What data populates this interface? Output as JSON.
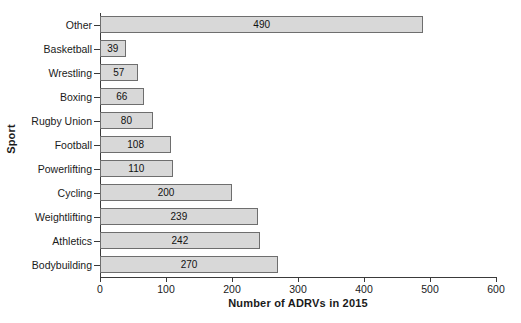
{
  "chart_data": {
    "type": "bar",
    "orientation": "horizontal",
    "title": "",
    "xlabel": "Number of ADRVs in 2015",
    "ylabel": "Sport",
    "categories": [
      "Other",
      "Basketball",
      "Wrestling",
      "Boxing",
      "Rugby Union",
      "Football",
      "Powerlifting",
      "Cycling",
      "Weightlifting",
      "Athletics",
      "Bodybuilding"
    ],
    "values": [
      490,
      39,
      57,
      66,
      80,
      108,
      110,
      200,
      239,
      242,
      270
    ],
    "data_labels": [
      "490",
      "39",
      "57",
      "66",
      "80",
      "108",
      "110",
      "200",
      "239",
      "242",
      "270"
    ],
    "xlim": [
      0,
      600
    ],
    "xticks": [
      0,
      100,
      200,
      300,
      400,
      500,
      600
    ],
    "xtick_labels": [
      "0",
      "100",
      "200",
      "300",
      "400",
      "500",
      "600"
    ],
    "grid": false,
    "legend": false,
    "bar_fill_color": "#d8d8d8",
    "bar_border_color": "#6e6e6e",
    "background_color": "#ffffff",
    "axis_color": "#3a3a3a",
    "text_color": "#1a1a1a"
  }
}
